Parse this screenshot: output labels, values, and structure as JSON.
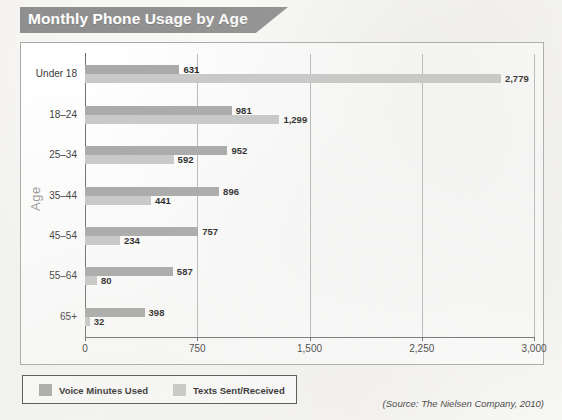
{
  "figure": {
    "title": "Monthly Phone Usage by Age",
    "source_note": "(Source: The Nielsen Company, 2010)"
  },
  "legend": {
    "items": [
      {
        "label": "Voice Minutes Used",
        "color": "#a9a9a9",
        "key": "voice"
      },
      {
        "label": "Texts Sent/Received",
        "color": "#c9c9c9",
        "key": "texts"
      }
    ]
  },
  "chart_data": {
    "type": "bar",
    "orientation": "horizontal",
    "title": "Monthly Phone Usage by Age",
    "xlabel": "",
    "ylabel": "Age",
    "xlim": [
      0,
      3000
    ],
    "xticks": [
      0,
      750,
      1500,
      2250,
      3000
    ],
    "xticklabels": [
      "0",
      "750",
      "1,500",
      "2,250",
      "3,000"
    ],
    "grid": true,
    "grid_axis": "x",
    "legend_position": "below-plot-left",
    "categories": [
      "Under 18",
      "18–24",
      "25–34",
      "35–44",
      "45–54",
      "55–64",
      "65+"
    ],
    "series": [
      {
        "name": "Voice Minutes Used",
        "color": "#a9a9a9",
        "values": [
          631,
          981,
          952,
          896,
          757,
          587,
          398
        ],
        "labels": [
          "631",
          "981",
          "952",
          "896",
          "757",
          "587",
          "398"
        ]
      },
      {
        "name": "Texts Sent/Received",
        "color": "#c9c9c9",
        "values": [
          2779,
          1299,
          592,
          441,
          234,
          80,
          32
        ],
        "labels": [
          "2,779",
          "1,299",
          "592",
          "441",
          "234",
          "80",
          "32"
        ]
      }
    ],
    "source": "(Source: The Nielsen Company, 2010)"
  }
}
